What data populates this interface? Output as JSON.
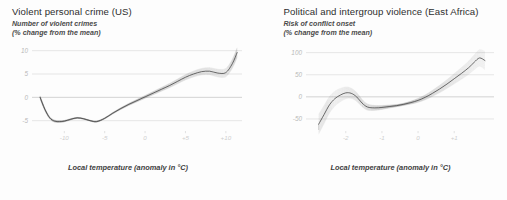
{
  "chart_data": [
    {
      "type": "line",
      "panel": "left",
      "title": "Violent personal crime (US)",
      "subtitle_line1": "Number of violent crimes",
      "subtitle_line2": "(% change from the mean)",
      "xlabel": "Local temperature (anomaly in °C)",
      "ylabel": "",
      "xlim": [
        -14,
        12
      ],
      "ylim": [
        -7,
        11
      ],
      "xticks": [
        "-10",
        "-5",
        "0",
        "+5",
        "+10"
      ],
      "xtick_values": [
        -10,
        -5,
        0,
        5,
        10
      ],
      "yticks": [
        "10",
        "5",
        "0",
        "-5"
      ],
      "ytick_values": [
        10,
        5,
        0,
        -5
      ],
      "grid": true,
      "legend": "none",
      "uncertainty_band": true,
      "x": [
        -13.0,
        -12.4,
        -11.8,
        -11.2,
        -10.6,
        -10.0,
        -9.2,
        -8.4,
        -7.6,
        -6.8,
        -6.0,
        -5.0,
        -4.0,
        -3.0,
        -2.0,
        -1.0,
        0.0,
        1.0,
        2.0,
        3.0,
        4.0,
        5.0,
        6.0,
        7.0,
        8.0,
        9.0,
        10.0,
        10.8,
        11.4
      ],
      "y": [
        0.0,
        -2.6,
        -4.4,
        -5.1,
        -5.2,
        -5.1,
        -4.7,
        -4.4,
        -4.6,
        -5.0,
        -5.2,
        -4.5,
        -3.4,
        -2.4,
        -1.5,
        -0.7,
        0.1,
        0.9,
        1.7,
        2.5,
        3.4,
        4.3,
        5.0,
        5.5,
        5.6,
        5.2,
        5.3,
        7.2,
        9.6
      ]
    },
    {
      "type": "line",
      "panel": "right",
      "title": "Political and intergroup violence (East Africa)",
      "subtitle_line1": "Risk of conflict onset",
      "subtitle_line2": "(% change from the mean)",
      "xlabel": "Local temperature (anomaly in °C)",
      "ylabel": "",
      "xlim": [
        -3.1,
        2.1
      ],
      "ylim": [
        -75,
        115
      ],
      "xticks": [
        "-2",
        "-1",
        "0",
        "+1"
      ],
      "xtick_values": [
        -2,
        -1,
        0,
        1
      ],
      "yticks": [
        "100",
        "50",
        "0",
        "-50"
      ],
      "ytick_values": [
        100,
        50,
        0,
        -50
      ],
      "grid": true,
      "legend": "none",
      "uncertainty_band": true,
      "x": [
        -2.75,
        -2.6,
        -2.45,
        -2.3,
        -2.15,
        -2.0,
        -1.85,
        -1.7,
        -1.55,
        -1.4,
        -1.2,
        -1.0,
        -0.8,
        -0.6,
        -0.4,
        -0.2,
        0.0,
        0.2,
        0.4,
        0.6,
        0.8,
        1.0,
        1.2,
        1.4,
        1.55,
        1.7,
        1.85
      ],
      "y": [
        -62.0,
        -40.0,
        -18.0,
        -4.0,
        4.0,
        9.0,
        8.0,
        0.0,
        -14.0,
        -23.0,
        -25.0,
        -24.0,
        -22.0,
        -20.0,
        -17.0,
        -13.0,
        -8.0,
        -1.0,
        8.0,
        18.0,
        29.0,
        41.0,
        53.0,
        66.0,
        78.0,
        88.0,
        82.0
      ]
    }
  ],
  "colors": {
    "background": "#fdfdfd",
    "line": "#3f3f3f",
    "grid": "#d7d7d7",
    "title": "#2d2d2d",
    "tick": "#c9c9c9"
  }
}
